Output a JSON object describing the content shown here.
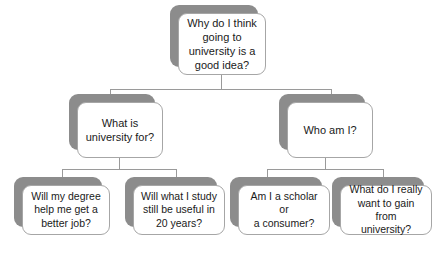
{
  "diagram": {
    "type": "hierarchy-tree",
    "title": "Why do I think going to university is a good idea?",
    "background_color": "#ffffff",
    "box_fill_color": "#ffffff",
    "box_border_color": "#a6a6a6",
    "shadow_color": "#8c8c8c",
    "connector_color": "#9a9a9a",
    "text_color": "#1a1a1a",
    "levels": 3,
    "nodes": {
      "root": {
        "id": "root",
        "level": 0,
        "text": "Why do I think\ngoing to\nuniversity is a\ngood idea?"
      },
      "branch_left": {
        "id": "branch-left",
        "level": 1,
        "text": "What is\nuniversity for?"
      },
      "branch_right": {
        "id": "branch-right",
        "level": 1,
        "text": "Who am I?"
      },
      "leaf_1": {
        "id": "leaf-1",
        "level": 2,
        "parent": "branch-left",
        "text": "Will my degree\nhelp me get a\nbetter job?"
      },
      "leaf_2": {
        "id": "leaf-2",
        "level": 2,
        "parent": "branch-left",
        "text": "Will what I study\nstill be useful in\n20 years?"
      },
      "leaf_3": {
        "id": "leaf-3",
        "level": 2,
        "parent": "branch-right",
        "text": "Am I a scholar or\na consumer?"
      },
      "leaf_4": {
        "id": "leaf-4",
        "level": 2,
        "parent": "branch-right",
        "text": "What do I really\nwant to gain from\nuniversity?"
      }
    }
  }
}
